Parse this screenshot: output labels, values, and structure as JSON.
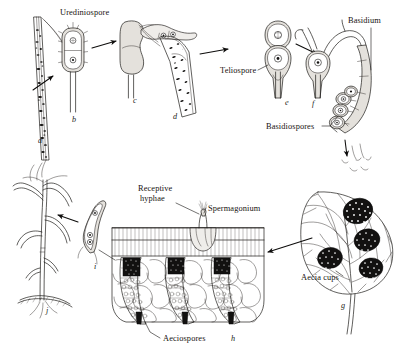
{
  "figure": {
    "background_color": "#ffffff",
    "ink_color": "#1d1b19",
    "width": 400,
    "height": 356
  },
  "labels": [
    {
      "id": "urediniospore",
      "text": "Urediniospore",
      "x": 60,
      "y": 15,
      "anchor": "start"
    },
    {
      "id": "teliospore",
      "text": "Teliospore",
      "x": 220,
      "y": 73,
      "anchor": "start"
    },
    {
      "id": "basidium",
      "text": "Basidium",
      "x": 348,
      "y": 23,
      "anchor": "start"
    },
    {
      "id": "basidiospores",
      "text": "Basidiospores",
      "x": 266,
      "y": 129,
      "anchor": "start"
    },
    {
      "id": "receptive-hyphae-line1",
      "text": "Receptive",
      "x": 138,
      "y": 191,
      "anchor": "start"
    },
    {
      "id": "receptive-hyphae-line2",
      "text": "hyphae",
      "x": 140,
      "y": 201,
      "anchor": "start"
    },
    {
      "id": "spermagonium",
      "text": "Spermagonium",
      "x": 208,
      "y": 211,
      "anchor": "start"
    },
    {
      "id": "aecia-cups",
      "text": "Aecia cups",
      "x": 301,
      "y": 280,
      "anchor": "start"
    },
    {
      "id": "aeciospores",
      "text": "Aeciospores",
      "x": 163,
      "y": 341,
      "anchor": "start"
    }
  ],
  "panel_letters": [
    {
      "id": "a",
      "text": "a",
      "x": 38,
      "y": 143
    },
    {
      "id": "b",
      "text": "b",
      "x": 72,
      "y": 122
    },
    {
      "id": "c",
      "text": "c",
      "x": 133,
      "y": 103
    },
    {
      "id": "d",
      "text": "d",
      "x": 173,
      "y": 119
    },
    {
      "id": "e",
      "text": "e",
      "x": 285,
      "y": 105
    },
    {
      "id": "f",
      "text": "f",
      "x": 312,
      "y": 106
    },
    {
      "id": "g",
      "text": "g",
      "x": 341,
      "y": 308
    },
    {
      "id": "h",
      "text": "h",
      "x": 231,
      "y": 341
    },
    {
      "id": "i",
      "text": "i",
      "x": 94,
      "y": 269
    },
    {
      "id": "j",
      "text": "j",
      "x": 46,
      "y": 313
    }
  ],
  "stages": [
    {
      "letter": "a",
      "name": "infected-wheat-stem-uredinia"
    },
    {
      "letter": "b",
      "name": "urediniospore-two-celled"
    },
    {
      "letter": "c",
      "name": "germinating-urediniospore"
    },
    {
      "letter": "d",
      "name": "infected-stem-telia"
    },
    {
      "letter": "e",
      "name": "two-celled-teliospore"
    },
    {
      "letter": "f",
      "name": "teliospore-germinating-basidium"
    },
    {
      "letter": "g",
      "name": "barberry-leaf-with-aecia"
    },
    {
      "letter": "h",
      "name": "barberry-leaf-section-spermagonium-aecium"
    },
    {
      "letter": "i",
      "name": "germinating-aeciospore"
    },
    {
      "letter": "j",
      "name": "wheat-plant-seedling"
    }
  ]
}
